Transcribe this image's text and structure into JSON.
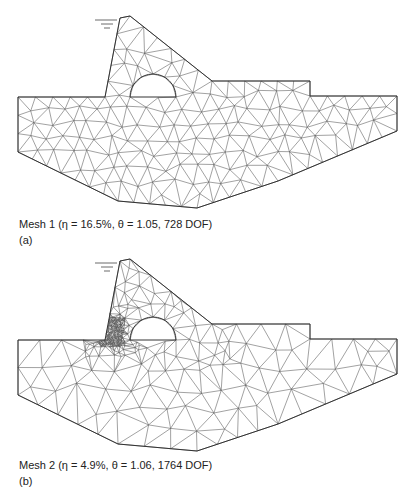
{
  "figures": [
    {
      "id": "a",
      "caption": "Mesh 1 (η = 16.5%, θ = 1.05, 728 DOF)",
      "label": "(a)",
      "mesh_name": "Mesh 1",
      "eta": "16.5%",
      "theta": "1.05",
      "dof": "728 DOF",
      "refinement": "uniform"
    },
    {
      "id": "b",
      "caption": "Mesh 2 (η = 4.9%, θ = 1.06, 1764 DOF)",
      "label": "(b)",
      "mesh_name": "Mesh 2",
      "eta": "4.9%",
      "theta": "1.06",
      "dof": "1764 DOF",
      "refinement": "adaptive, refined at dam heel"
    }
  ],
  "colors": {
    "line": "#555555",
    "outline": "#333333",
    "background": "#ffffff"
  },
  "icons": {
    "water_level": "water-level-symbol"
  }
}
